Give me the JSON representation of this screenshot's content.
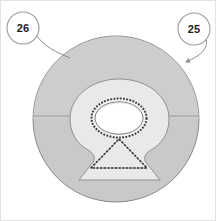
{
  "figure": {
    "canvas": {
      "width": 216,
      "height": 221,
      "background": "#ffffff"
    },
    "colors": {
      "disc_fill": "#c9c9c9",
      "disc_stroke": "#8a8a8a",
      "keyhole_fill": "#e9e9e9",
      "keyhole_stroke": "#8f8f8f",
      "aperture_fill": "#ffffff",
      "aperture_stroke": "#3c3c3c",
      "triangle_stroke": "#2f2f2f",
      "leader_stroke": "#8c8c8c",
      "callout_stroke": "#9a9a9a",
      "text": "#1d1d1d",
      "frame": "#e2e2e2"
    },
    "shapes": {
      "disc": {
        "name": "outer-disc",
        "cx": 116,
        "cy": 119,
        "r": 83
      },
      "divider": {
        "name": "horizontal-diameter",
        "y": 116
      },
      "keyhole": {
        "name": "keyhole-region"
      },
      "aperture": {
        "name": "aperture-ellipse",
        "cx": 119,
        "cy": 118,
        "rx": 27,
        "ry": 19
      },
      "triangle": {
        "name": "triangle-marker",
        "apex_x": 119,
        "apex_y": 139,
        "base_y": 168,
        "half_width": 28
      }
    },
    "callouts": [
      {
        "id": "callout-26",
        "label": "26",
        "cx": 23,
        "cy": 28,
        "r": 16,
        "has_arrow": false,
        "leader_target_x": 70,
        "leader_target_y": 58
      },
      {
        "id": "callout-25",
        "label": "25",
        "cx": 194,
        "cy": 29,
        "r": 16,
        "has_arrow": true,
        "leader_target_x": 184,
        "leader_target_y": 62
      }
    ]
  }
}
